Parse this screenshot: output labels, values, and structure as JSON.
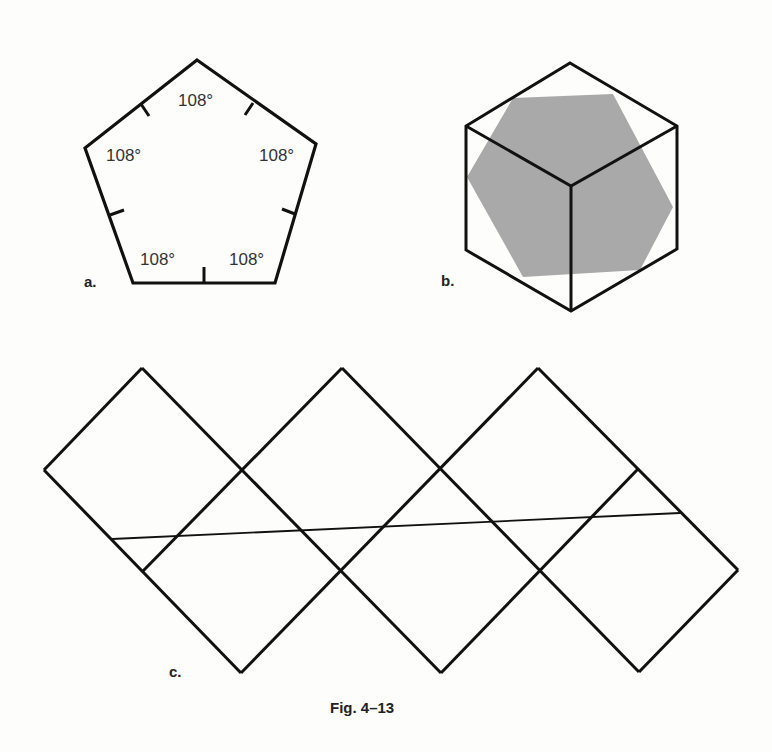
{
  "figure": {
    "caption": "Fig. 4–13",
    "colors": {
      "stroke": "#111111",
      "shade": "#a8a8a8",
      "background": "#fdfdfb"
    }
  },
  "panel_a": {
    "label": "a.",
    "shape": "regular pentagon",
    "angles": [
      {
        "text": "108°",
        "x": 178,
        "y": 106
      },
      {
        "text": "108°",
        "x": 106,
        "y": 161
      },
      {
        "text": "108°",
        "x": 259,
        "y": 161
      },
      {
        "text": "108°",
        "x": 140,
        "y": 265
      },
      {
        "text": "108°",
        "x": 229,
        "y": 265
      }
    ]
  },
  "panel_b": {
    "label": "b.",
    "shape": "cube with hexagonal cross-section"
  },
  "panel_c": {
    "label": "c.",
    "shape": "cube net with straight line"
  }
}
